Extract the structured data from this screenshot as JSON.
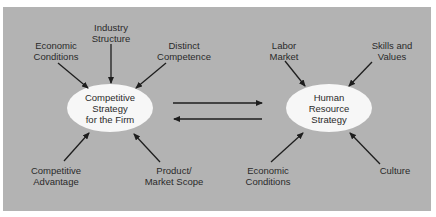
{
  "diagram": {
    "left_node": {
      "label": "Competitive\nStrategy\nfor the Firm"
    },
    "right_node": {
      "label": "Human\nResource\nStrategy"
    },
    "left_inputs": [
      {
        "label": "Economic\nConditions"
      },
      {
        "label": "Industry\nStructure"
      },
      {
        "label": "Distinct\nCompetence"
      },
      {
        "label": "Competitive\nAdvantage"
      },
      {
        "label": "Product/\nMarket Scope"
      }
    ],
    "right_inputs": [
      {
        "label": "Labor\nMarket"
      },
      {
        "label": "Skills and\nValues"
      },
      {
        "label": "Economic\nConditions"
      },
      {
        "label": "Culture"
      }
    ],
    "links": [
      {
        "from": "Competitive Strategy for the Firm",
        "to": "Human Resource Strategy"
      },
      {
        "from": "Human Resource Strategy",
        "to": "Competitive Strategy for the Firm"
      }
    ],
    "colors": {
      "background": "#b3b3b3",
      "node_fill": "#f7f7f7",
      "arrow": "#1e1e1e"
    }
  }
}
